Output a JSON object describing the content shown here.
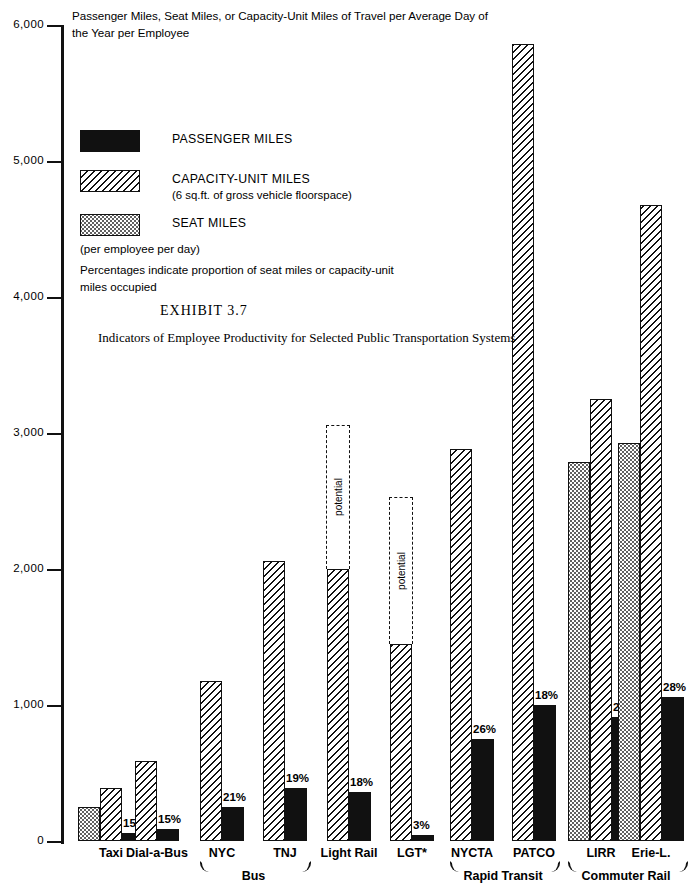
{
  "header_note": "Passenger Miles, Seat Miles, or Capacity-Unit Miles of Travel per Average Day of the Year per Employee",
  "legend": {
    "items": [
      {
        "key": "passenger",
        "label": "PASSENGER MILES",
        "sub": ""
      },
      {
        "key": "capacity",
        "label": "CAPACITY-UNIT MILES",
        "sub": "(6 sq.ft. of gross vehicle floorspace)"
      },
      {
        "key": "seat",
        "label": "SEAT MILES",
        "sub": ""
      }
    ],
    "note1": "(per employee per day)",
    "note2": "Percentages indicate proportion  of seat miles or capacity-unit miles occupied"
  },
  "exhibit": {
    "number": "EXHIBIT  3.7",
    "subtitle": "Indicators of Employee Productivity for Selected Public Transportation Systems"
  },
  "chart_data": {
    "type": "bar",
    "title": "Indicators of Employee Productivity for Selected Public Transportation Systems",
    "subtitle": "Passenger Miles, Seat Miles, or Capacity-Unit Miles of Travel per Average Day of the Year per Employee",
    "xlabel": "",
    "ylabel": "Passenger Miles, Seat Miles, or Capacity-Unit Miles of Travel per Average Day of the Year per Employee",
    "ylim": [
      0,
      6000
    ],
    "ytick_labels": [
      "0",
      "1,000",
      "2,000",
      "3,000",
      "4,000",
      "5,000",
      "6,000"
    ],
    "ytick_values": [
      0,
      1000,
      2000,
      3000,
      4000,
      5000,
      6000
    ],
    "grid": false,
    "legend_position": "upper-left",
    "series": [
      {
        "name": "SEAT MILES",
        "key": "seat"
      },
      {
        "name": "CAPACITY-UNIT MILES",
        "key": "capacity"
      },
      {
        "name": "PASSENGER MILES",
        "key": "passenger"
      }
    ],
    "categories": [
      "Taxi",
      "Dial-a-Bus",
      "NYC",
      "TNJ",
      "Light Rail",
      "LGT*",
      "NYCTA",
      "PATCO",
      "LIRR",
      "Erie-L."
    ],
    "groups": [
      {
        "label": "Bus",
        "members": [
          "NYC",
          "TNJ"
        ]
      },
      {
        "label": "Rapid Transit",
        "members": [
          "NYCTA",
          "PATCO"
        ]
      },
      {
        "label": "Commuter Rail",
        "members": [
          "LIRR",
          "Erie-L."
        ]
      }
    ],
    "points": [
      {
        "category": "Taxi",
        "seat": 250,
        "capacity": 390,
        "passenger": 58,
        "percent": "15%",
        "potential": null
      },
      {
        "category": "Dial-a-Bus",
        "seat": null,
        "capacity": 590,
        "passenger": 88,
        "percent": "15%",
        "potential": null
      },
      {
        "category": "NYC",
        "seat": null,
        "capacity": 1180,
        "passenger": 250,
        "percent": "21%",
        "potential": null
      },
      {
        "category": "TNJ",
        "seat": null,
        "capacity": 2060,
        "passenger": 390,
        "percent": "19%",
        "potential": null
      },
      {
        "category": "Light Rail",
        "seat": null,
        "capacity": 2000,
        "passenger": 360,
        "percent": "18%",
        "potential": 3060
      },
      {
        "category": "LGT*",
        "seat": null,
        "capacity": 1450,
        "passenger": 44,
        "percent": "3%",
        "potential": 2530
      },
      {
        "category": "NYCTA",
        "seat": null,
        "capacity": 2880,
        "passenger": 750,
        "percent": "26%",
        "potential": null
      },
      {
        "category": "PATCO",
        "seat": null,
        "capacity": 5860,
        "passenger": 1000,
        "percent": "18%",
        "potential": null
      },
      {
        "category": "LIRR",
        "seat": 2790,
        "capacity": 3250,
        "passenger": 910,
        "percent": "28%",
        "potential": null
      },
      {
        "category": "Erie-L.",
        "seat": 2930,
        "capacity": 4680,
        "passenger": 1060,
        "percent": "28%",
        "potential": null
      }
    ],
    "potential_label": "potential"
  }
}
